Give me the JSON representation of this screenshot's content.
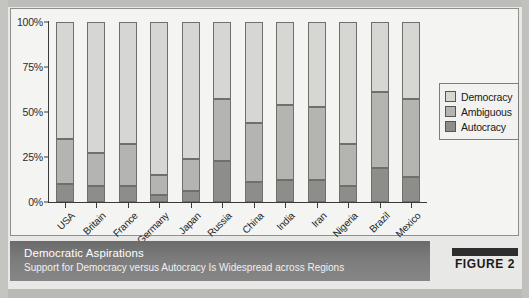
{
  "chart_data": {
    "type": "bar",
    "subtype": "stacked-100",
    "title": "Democratic Aspirations",
    "subtitle": "Support for Democracy versus Autocracy Is Widespread across Regions",
    "xlabel": "",
    "ylabel": "",
    "ylim": [
      0,
      100
    ],
    "yticks": [
      "0%",
      "25%",
      "50%",
      "75%",
      "100%"
    ],
    "ytick_values": [
      0,
      25,
      50,
      75,
      100
    ],
    "grid": false,
    "legend_position": "right",
    "categories": [
      "USA",
      "Britain",
      "France",
      "Germany",
      "Japan",
      "Russia",
      "China",
      "India",
      "Iran",
      "Nigeria",
      "Brazil",
      "Mexico"
    ],
    "series": [
      {
        "name": "Autocracy",
        "color": "#8d8d8a",
        "values": [
          10,
          9,
          9,
          4,
          6,
          23,
          11,
          12,
          12,
          9,
          19,
          14
        ]
      },
      {
        "name": "Ambiguous",
        "color": "#b4b4b0",
        "values": [
          25,
          18,
          23,
          11,
          18,
          34,
          33,
          42,
          41,
          23,
          42,
          43
        ]
      },
      {
        "name": "Democracy",
        "color": "#d6d6d2",
        "values": [
          65,
          73,
          68,
          85,
          76,
          43,
          56,
          46,
          47,
          68,
          39,
          43
        ]
      }
    ],
    "cumulative_tops": {
      "autocracy": [
        10,
        9,
        9,
        4,
        6,
        23,
        11,
        12,
        12,
        9,
        19,
        14
      ],
      "ambiguous": [
        35,
        27,
        32,
        15,
        24,
        57,
        44,
        54,
        53,
        32,
        61,
        57
      ],
      "democracy": [
        100,
        100,
        100,
        100,
        100,
        100,
        100,
        100,
        100,
        100,
        100,
        100
      ]
    }
  },
  "legend": {
    "items": [
      {
        "label": "Democracy",
        "color": "#d6d6d2"
      },
      {
        "label": "Ambiguous",
        "color": "#b4b4b0"
      },
      {
        "label": "Autocracy",
        "color": "#8d8d8a"
      }
    ]
  },
  "caption": {
    "title": "Democratic Aspirations",
    "subtitle": "Support for Democracy versus Autocracy Is Widespread across Regions"
  },
  "figure_badge": {
    "label": "FIGURE 2"
  }
}
